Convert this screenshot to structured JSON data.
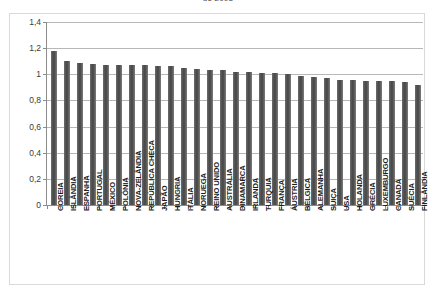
{
  "chart_data": {
    "type": "bar",
    "title": "de 2008",
    "xlabel": "",
    "ylabel": "",
    "ylim": [
      0,
      1.4
    ],
    "ytick_labels": [
      "0",
      "0,2",
      "0,4",
      "0,6",
      "0,8",
      "1",
      "1,2",
      "1,4"
    ],
    "ytick_values": [
      0,
      0.2,
      0.4,
      0.6,
      0.8,
      1.0,
      1.2,
      1.4
    ],
    "grid": true,
    "legend": false,
    "decimal_separator": ",",
    "bar_color": "#585858",
    "categories": [
      "COREIA",
      "ISLÂNDIA",
      "ESPANHA",
      "PORTUGAL",
      "MÉXICO",
      "POLÓNIA",
      "NOVA-ZELÂNDIA",
      "REPÚBLICA CHECA",
      "JAPÃO",
      "HUNGRIA",
      "ITÁLIA",
      "NORUEGA",
      "REINO UNIDO",
      "AUSTRÁLIA",
      "DINAMARCA",
      "IRLANDA",
      "TURQUIA",
      "FRANÇA",
      "ÁUSTRIA",
      "BÉLGICA",
      "ALEMANHA",
      "SUIÇA",
      "USA",
      "HOLANDA",
      "GRÉCIA",
      "LUXEMBURGO",
      "CANADÁ",
      "SUÉCIA",
      "FINLÂNDIA"
    ],
    "values": [
      1.18,
      1.1,
      1.09,
      1.08,
      1.07,
      1.07,
      1.07,
      1.07,
      1.06,
      1.06,
      1.05,
      1.04,
      1.03,
      1.03,
      1.02,
      1.02,
      1.01,
      1.01,
      1.0,
      0.99,
      0.98,
      0.97,
      0.96,
      0.96,
      0.95,
      0.95,
      0.95,
      0.94,
      0.92
    ]
  }
}
